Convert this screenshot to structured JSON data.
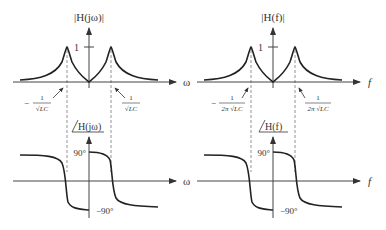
{
  "left": {
    "magnitude": {
      "ylabel": "|H(jω)|",
      "xlabel": "ω",
      "tick_one": "1",
      "neg_freq_label": {
        "sign": "−",
        "num": "1",
        "den": "√LC"
      },
      "pos_freq_label": {
        "num": "1",
        "den": "√LC"
      }
    },
    "phase": {
      "ylabel": "H(jω)",
      "xlabel": "ω",
      "tick_pos": "90°",
      "tick_neg": "−90°"
    }
  },
  "right": {
    "magnitude": {
      "ylabel": "|H(f)|",
      "xlabel": "f",
      "tick_one": "1",
      "neg_freq_label": {
        "sign": "−",
        "num": "1",
        "den": "2π √LC"
      },
      "pos_freq_label": {
        "num": "1",
        "den": "2π √LC"
      }
    },
    "phase": {
      "ylabel": "H(f)",
      "xlabel": "f",
      "tick_pos": "90°",
      "tick_neg": "−90°"
    }
  },
  "colors": {
    "curve": "#222222",
    "axis": "#444444",
    "guide": "#777777"
  }
}
